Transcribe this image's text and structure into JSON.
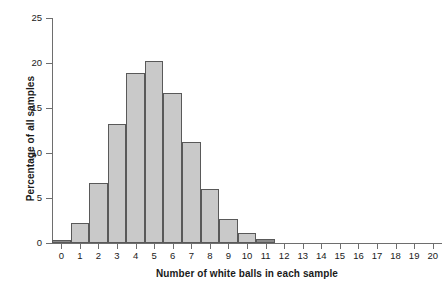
{
  "chart_data": {
    "type": "bar",
    "title": "",
    "subtitle": "",
    "xlabel": "Number of white balls in each sample",
    "ylabel": "Percentage of all samples",
    "categories": [
      "0",
      "1",
      "2",
      "3",
      "4",
      "5",
      "6",
      "7",
      "8",
      "9",
      "10",
      "11",
      "12",
      "13",
      "14",
      "15",
      "16",
      "17",
      "18",
      "19",
      "20"
    ],
    "values": [
      0.3,
      2.2,
      6.7,
      13.2,
      18.9,
      20.2,
      16.7,
      11.2,
      6.0,
      2.7,
      1.1,
      0.4,
      0,
      0,
      0,
      0,
      0,
      0,
      0,
      0,
      0
    ],
    "xlim": [
      -0.5,
      20.5
    ],
    "ylim": [
      0,
      25
    ],
    "ytick_labels": [
      "0",
      "5",
      "10",
      "15",
      "20",
      "25"
    ],
    "ytick_values": [
      0,
      5,
      10,
      15,
      20,
      25
    ],
    "xtick_labels": [
      "0",
      "1",
      "2",
      "3",
      "4",
      "5",
      "6",
      "7",
      "8",
      "9",
      "10",
      "11",
      "12",
      "13",
      "14",
      "15",
      "16",
      "17",
      "18",
      "19",
      "20"
    ],
    "grid": false,
    "legend": null,
    "bar_fill_color": "#c9c9c9",
    "bar_edge_color": "#595959",
    "axis_color": "#6e6e6e",
    "text_color": "#1a1a1a",
    "background_color": "#ffffff"
  }
}
